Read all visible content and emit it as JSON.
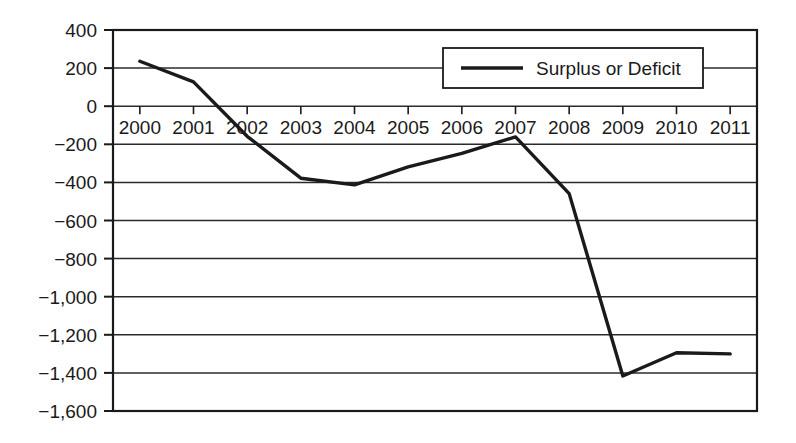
{
  "chart_data": {
    "type": "line",
    "title": "",
    "xlabel": "",
    "ylabel": "",
    "categories": [
      "2000",
      "2001",
      "2002",
      "2003",
      "2004",
      "2005",
      "2006",
      "2007",
      "2008",
      "2009",
      "2010",
      "2011"
    ],
    "series": [
      {
        "name": "Surplus or Deficit",
        "values": [
          236,
          128,
          -158,
          -378,
          -413,
          -318,
          -248,
          -161,
          -459,
          -1416,
          -1294,
          -1300
        ]
      }
    ],
    "ytick_labels": [
      "400",
      "200",
      "0",
      "−200",
      "−400",
      "−600",
      "−800",
      "−1,000",
      "−1,200",
      "−1,400",
      "−1,600"
    ],
    "ytick_values": [
      400,
      200,
      0,
      -200,
      -400,
      -600,
      -800,
      -1000,
      -1200,
      -1400,
      -1600
    ],
    "ylim": [
      -1600,
      400
    ],
    "grid": "horizontal",
    "legend_position": "top-right-inside",
    "line_color": "#1a1a1a",
    "frame_color": "#1a1a1a",
    "background_color": "#ffffff"
  },
  "legend": {
    "entries": [
      {
        "label": "Surplus or Deficit",
        "swatch": "line-swatch",
        "color": "#1a1a1a"
      }
    ]
  }
}
